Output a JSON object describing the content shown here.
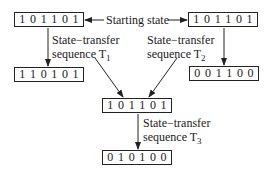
{
  "diagram": {
    "start_label": "Starting state",
    "nodes": {
      "start_left": {
        "bits": [
          "1",
          "0",
          "1",
          "1",
          "0",
          "1"
        ]
      },
      "start_right": {
        "bits": [
          "1",
          "0",
          "1",
          "1",
          "0",
          "1"
        ]
      },
      "result_t1": {
        "bits": [
          "1",
          "1",
          "0",
          "1",
          "0",
          "1"
        ]
      },
      "result_t2": {
        "bits": [
          "0",
          "0",
          "1",
          "1",
          "0",
          "0"
        ]
      },
      "middle": {
        "bits": [
          "1",
          "0",
          "1",
          "1",
          "0",
          "1"
        ]
      },
      "result_t3": {
        "bits": [
          "0",
          "1",
          "0",
          "1",
          "0",
          "0"
        ]
      }
    },
    "transitions": {
      "t1": {
        "line1": "State−transfer",
        "line2": "sequence T",
        "sub": "1"
      },
      "t2": {
        "line1": "State−transfer",
        "line2": "sequence T",
        "sub": "2"
      },
      "t3": {
        "line1": "State−transfer",
        "line2": "sequence T",
        "sub": "3"
      }
    },
    "colors": {
      "line": "#222222",
      "text": "#1a1a1a",
      "background": "#ffffff"
    }
  }
}
